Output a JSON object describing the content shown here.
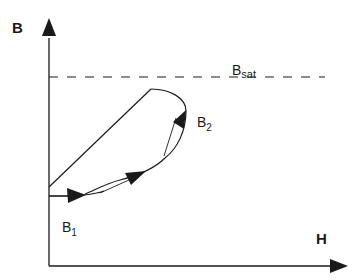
{
  "diagram": {
    "type": "B-H magnetization curve",
    "axes": {
      "y_label": "B",
      "x_label": "H"
    },
    "saturation_line": {
      "label_main": "B",
      "label_sub": "sat"
    },
    "points": [
      {
        "id": "b1",
        "label_main": "B",
        "label_sub": "1"
      },
      {
        "id": "b2",
        "label_main": "B",
        "label_sub": "2"
      }
    ],
    "colors": {
      "stroke": "#1a1a1a",
      "background": "#ffffff"
    }
  }
}
